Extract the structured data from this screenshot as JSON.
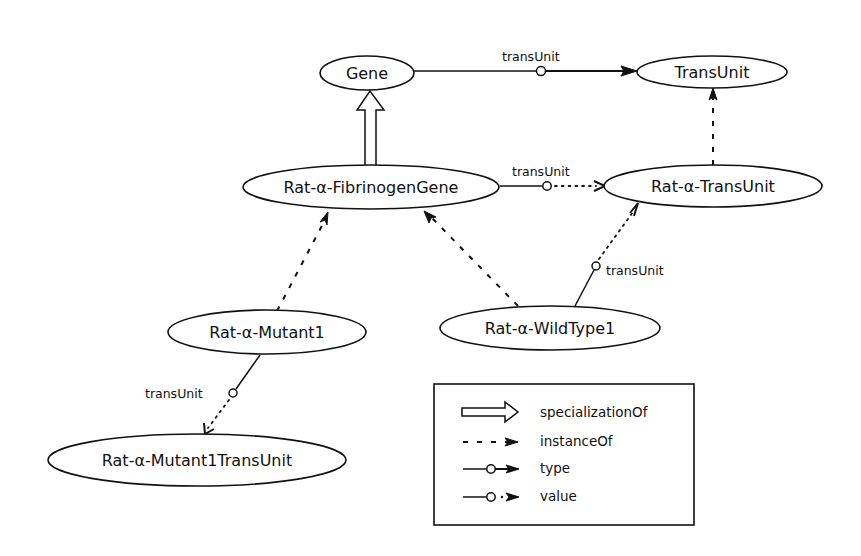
{
  "diagram": {
    "nodes": {
      "gene": "Gene",
      "trans_unit": "TransUnit",
      "fibrinogen_gene": "Rat-α-FibrinogenGene",
      "rat_trans_unit": "Rat-α-TransUnit",
      "mutant1": "Rat-α-Mutant1",
      "wild_type1": "Rat-α-WildType1",
      "mutant1_trans_unit": "Rat-α-Mutant1TransUnit"
    },
    "edges": [
      {
        "from": "Gene",
        "to": "TransUnit",
        "kind": "type",
        "label": "transUnit"
      },
      {
        "from": "Rat-α-FibrinogenGene",
        "to": "Gene",
        "kind": "specializationOf",
        "label": ""
      },
      {
        "from": "Rat-α-FibrinogenGene",
        "to": "Rat-α-TransUnit",
        "kind": "value",
        "label": "transUnit"
      },
      {
        "from": "Rat-α-TransUnit",
        "to": "TransUnit",
        "kind": "instanceOf",
        "label": ""
      },
      {
        "from": "Rat-α-Mutant1",
        "to": "Rat-α-FibrinogenGene",
        "kind": "instanceOf",
        "label": ""
      },
      {
        "from": "Rat-α-WildType1",
        "to": "Rat-α-FibrinogenGene",
        "kind": "instanceOf",
        "label": ""
      },
      {
        "from": "Rat-α-WildType1",
        "to": "Rat-α-TransUnit",
        "kind": "value",
        "label": "transUnit"
      },
      {
        "from": "Rat-α-Mutant1",
        "to": "Rat-α-Mutant1TransUnit",
        "kind": "value",
        "label": "transUnit"
      }
    ],
    "edge_labels": {
      "gene_transunit": "transUnit",
      "fibrinogen_rattransunit": "transUnit",
      "wildtype_rattransunit": "transUnit",
      "mutant_mutanttransunit": "transUnit"
    },
    "legend": {
      "items": [
        {
          "icon": "hollow-arrow",
          "label": "specializationOf"
        },
        {
          "icon": "dashed-arrow",
          "label": "instanceOf"
        },
        {
          "icon": "solid-circle-arrow",
          "label": "type"
        },
        {
          "icon": "dotted-circle-arrow",
          "label": "value"
        }
      ]
    },
    "colors": {
      "stroke": "#111111",
      "background": "#ffffff"
    }
  }
}
